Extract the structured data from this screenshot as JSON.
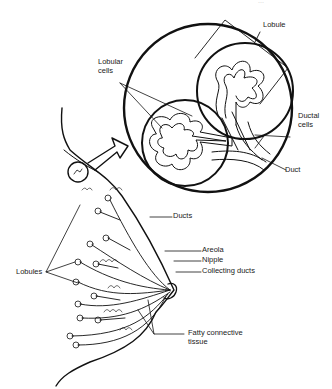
{
  "figure": {
    "top_right_cut_text": "...",
    "labels": {
      "lobule": "Lobule",
      "lobular_cells": "Lobular cells",
      "ductal_cells": "Ductal cells",
      "duct": "Duct",
      "ducts": "Ducts",
      "areola": "Areola",
      "nipple": "Nipple",
      "collecting_ducts": "Collecting ducts",
      "lobules": "Lobules",
      "fatty_connective_tissue": "Fatty connective tissue"
    },
    "colors": {
      "line": "#111111",
      "background": "#ffffff"
    }
  }
}
